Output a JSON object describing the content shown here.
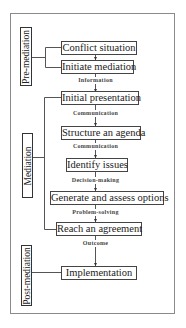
{
  "phases": [
    {
      "id": "pre",
      "label": "Pre-mediation"
    },
    {
      "id": "mediation",
      "label": "Mediation"
    },
    {
      "id": "post",
      "label": "Post-mediation"
    }
  ],
  "steps": [
    {
      "label": "Conflict situation",
      "phase": "Pre-mediation"
    },
    {
      "label": "Initiate mediation",
      "phase": "Pre-mediation"
    },
    {
      "label": "Initial presentation",
      "phase": "Mediation"
    },
    {
      "label": "Structure an agenda",
      "phase": "Mediation"
    },
    {
      "label": "Identify issues",
      "phase": "Mediation"
    },
    {
      "label": "Generate and assess options",
      "phase": "Mediation"
    },
    {
      "label": "Reach an agreement",
      "phase": "Mediation"
    },
    {
      "label": "Implementation",
      "phase": "Post-mediation"
    }
  ],
  "connectors": [
    {
      "label": "",
      "from": "Conflict situation",
      "to": "Initiate mediation"
    },
    {
      "label": "Information",
      "from": "Initiate mediation",
      "to": "Initial presentation"
    },
    {
      "label": "Communication",
      "from": "Initial presentation",
      "to": "Structure an agenda"
    },
    {
      "label": "Communication",
      "from": "Structure an agenda",
      "to": "Identify issues"
    },
    {
      "label": "Decision-making",
      "from": "Identify issues",
      "to": "Generate and assess options"
    },
    {
      "label": "Problem-solving",
      "from": "Generate and assess options",
      "to": "Reach an agreement"
    },
    {
      "label": "Outcome",
      "from": "Reach an agreement",
      "to": "Implementation"
    }
  ],
  "colors": {
    "frame": "#8a8a8a",
    "box_border": "#444444",
    "text": "#222222",
    "background": "#ffffff"
  }
}
